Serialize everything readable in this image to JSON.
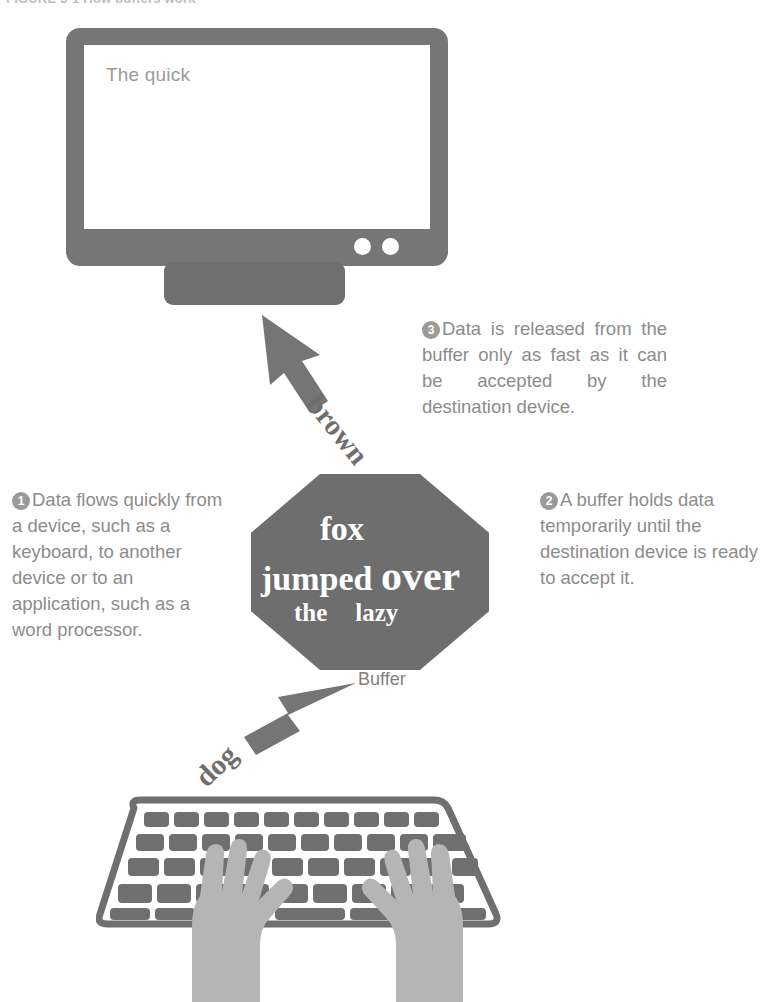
{
  "figure": {
    "title": "FIGURE 5-1 How buffers work"
  },
  "monitor": {
    "name": "monitor",
    "screen_text": "The quick",
    "dots": [
      "power-dot",
      "indicator-dot"
    ]
  },
  "buffer": {
    "shape": "octagon",
    "label": "Buffer",
    "lines": [
      "fox",
      "jumped ",
      "over",
      "the",
      "lazy"
    ],
    "color": "#6e6e6e",
    "text_color": "#ffffff"
  },
  "arrows": [
    {
      "id": "arrow-up-to-monitor",
      "word": "brown",
      "direction": "up-left"
    },
    {
      "id": "arrow-up-to-buffer",
      "word": "dog",
      "direction": "up-right"
    }
  ],
  "callouts": [
    {
      "number": "1",
      "text": "Data flows quickly from a device, such as a keyboard, to another device or to an application, such as a word processor."
    },
    {
      "number": "2",
      "text": "A buffer holds data temporarily until the destination device is ready to accept it."
    },
    {
      "number": "3",
      "text": "Data is released from the buffer only as fast as it can be accepted by the destination device."
    }
  ],
  "input_device": {
    "name": "keyboard",
    "hands": "typing-hands"
  },
  "colors": {
    "device_gray": "#767676",
    "shape_gray": "#6e6e6e",
    "text_gray": "#8c8c8c",
    "hand_gray": "#b3b3b3",
    "screen_white": "#ffffff"
  }
}
